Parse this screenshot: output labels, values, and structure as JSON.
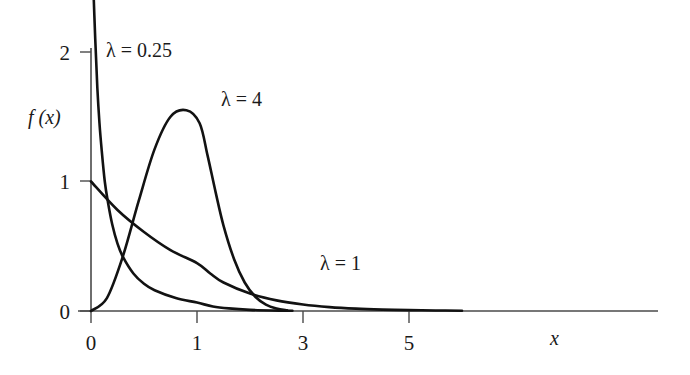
{
  "chart_data": {
    "type": "line",
    "title": "",
    "subtitle": "",
    "xlabel": "x",
    "ylabel": "f (x)",
    "xlim": [
      0,
      6.3
    ],
    "ylim": [
      0,
      2.15
    ],
    "grid": false,
    "legend_position": "inline-annotations",
    "xticks": [
      0,
      1,
      3,
      5
    ],
    "xticklabels": [
      "0",
      "1",
      "3",
      "5"
    ],
    "yticks": [
      0,
      1,
      2
    ],
    "yticklabels": [
      "0",
      "1",
      "2"
    ],
    "series": [
      {
        "name": "λ = 0.25",
        "label": "λ = 0.25",
        "lambda": 0.25,
        "annotation": "λ = 0.25",
        "x": [
          0.02,
          0.04,
          0.06,
          0.08,
          0.1,
          0.13,
          0.16,
          0.2,
          0.25,
          0.3,
          0.4,
          0.5,
          0.6,
          0.8,
          1.0,
          1.3,
          1.6,
          2.0,
          2.4,
          2.8
        ],
        "values": [
          2.55,
          2.1,
          1.72,
          1.45,
          1.25,
          1.0,
          0.84,
          0.67,
          0.52,
          0.42,
          0.29,
          0.21,
          0.16,
          0.1,
          0.065,
          0.035,
          0.02,
          0.009,
          0.004,
          0.002
        ]
      },
      {
        "name": "λ = 1",
        "label": "λ = 1",
        "lambda": 1,
        "annotation": "λ = 1",
        "x": [
          0.0,
          0.25,
          0.5,
          0.75,
          1.0,
          1.25,
          1.5,
          2.0,
          2.5,
          3.0,
          3.5,
          4.0,
          4.5,
          5.0,
          5.5,
          6.0
        ],
        "values": [
          1.0,
          0.78,
          0.61,
          0.47,
          0.37,
          0.29,
          0.22,
          0.135,
          0.082,
          0.05,
          0.03,
          0.018,
          0.011,
          0.0067,
          0.004,
          0.0025
        ]
      },
      {
        "name": "λ = 4",
        "label": "λ = 4",
        "lambda": 4,
        "annotation": "λ = 4",
        "peak_x": 0.9,
        "peak_y": 1.55,
        "x": [
          0.0,
          0.15,
          0.3,
          0.45,
          0.6,
          0.75,
          0.9,
          1.05,
          1.2,
          1.35,
          1.5,
          1.7,
          1.9,
          2.1,
          2.3,
          2.5,
          2.7
        ],
        "values": [
          0.0,
          0.1,
          0.42,
          0.85,
          1.25,
          1.5,
          1.55,
          1.45,
          1.2,
          0.92,
          0.66,
          0.4,
          0.22,
          0.11,
          0.05,
          0.02,
          0.005
        ]
      }
    ],
    "colors": {
      "curve": "#121212",
      "axis": "#4a4a4a",
      "background": "#ffffff",
      "text": "#1a1a1a"
    }
  }
}
